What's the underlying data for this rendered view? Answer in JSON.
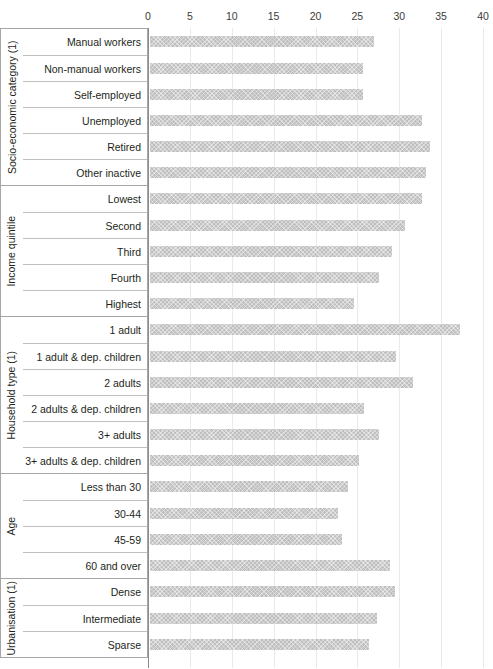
{
  "chart_data": {
    "type": "bar",
    "orientation": "horizontal",
    "title": "",
    "xlabel": "",
    "ylabel": "",
    "xlim": [
      0,
      40
    ],
    "xticks": [
      0,
      5,
      10,
      15,
      20,
      25,
      30,
      35,
      40
    ],
    "xtick_labels": [
      "0",
      "5",
      "10",
      "15",
      "20",
      "25",
      "30",
      "35",
      "40"
    ],
    "grid": true,
    "legend": "none",
    "bar_color": "#bfbfbf",
    "groups": [
      {
        "name": "Socio-economic category (1)",
        "categories": [
          "Manual workers",
          "Non-manual workers",
          "Self-employed",
          "Unemployed",
          "Retired",
          "Other inactive"
        ],
        "values": [
          26.8,
          25.4,
          25.4,
          32.5,
          33.4,
          32.9
        ]
      },
      {
        "name": "Income quintile",
        "categories": [
          "Lowest",
          "Second",
          "Third",
          "Fourth",
          "Highest"
        ],
        "values": [
          32.5,
          30.4,
          28.9,
          27.3,
          24.3
        ]
      },
      {
        "name": "Household type (1)",
        "categories": [
          "1 adult",
          "1 adult & dep. children",
          "2 adults",
          "2 adults & dep. children",
          "3+ adults",
          "3+ adults & dep. children"
        ],
        "values": [
          37.0,
          29.4,
          31.4,
          25.5,
          27.3,
          25.0
        ]
      },
      {
        "name": "Age",
        "categories": [
          "Less than 30",
          "30-44",
          "45-59",
          "60 and over"
        ],
        "values": [
          23.7,
          22.5,
          22.9,
          28.6
        ]
      },
      {
        "name": "Urbanisation (1)",
        "categories": [
          "Dense",
          "Intermediate",
          "Sparse"
        ],
        "values": [
          29.3,
          27.1,
          26.2
        ]
      }
    ]
  }
}
